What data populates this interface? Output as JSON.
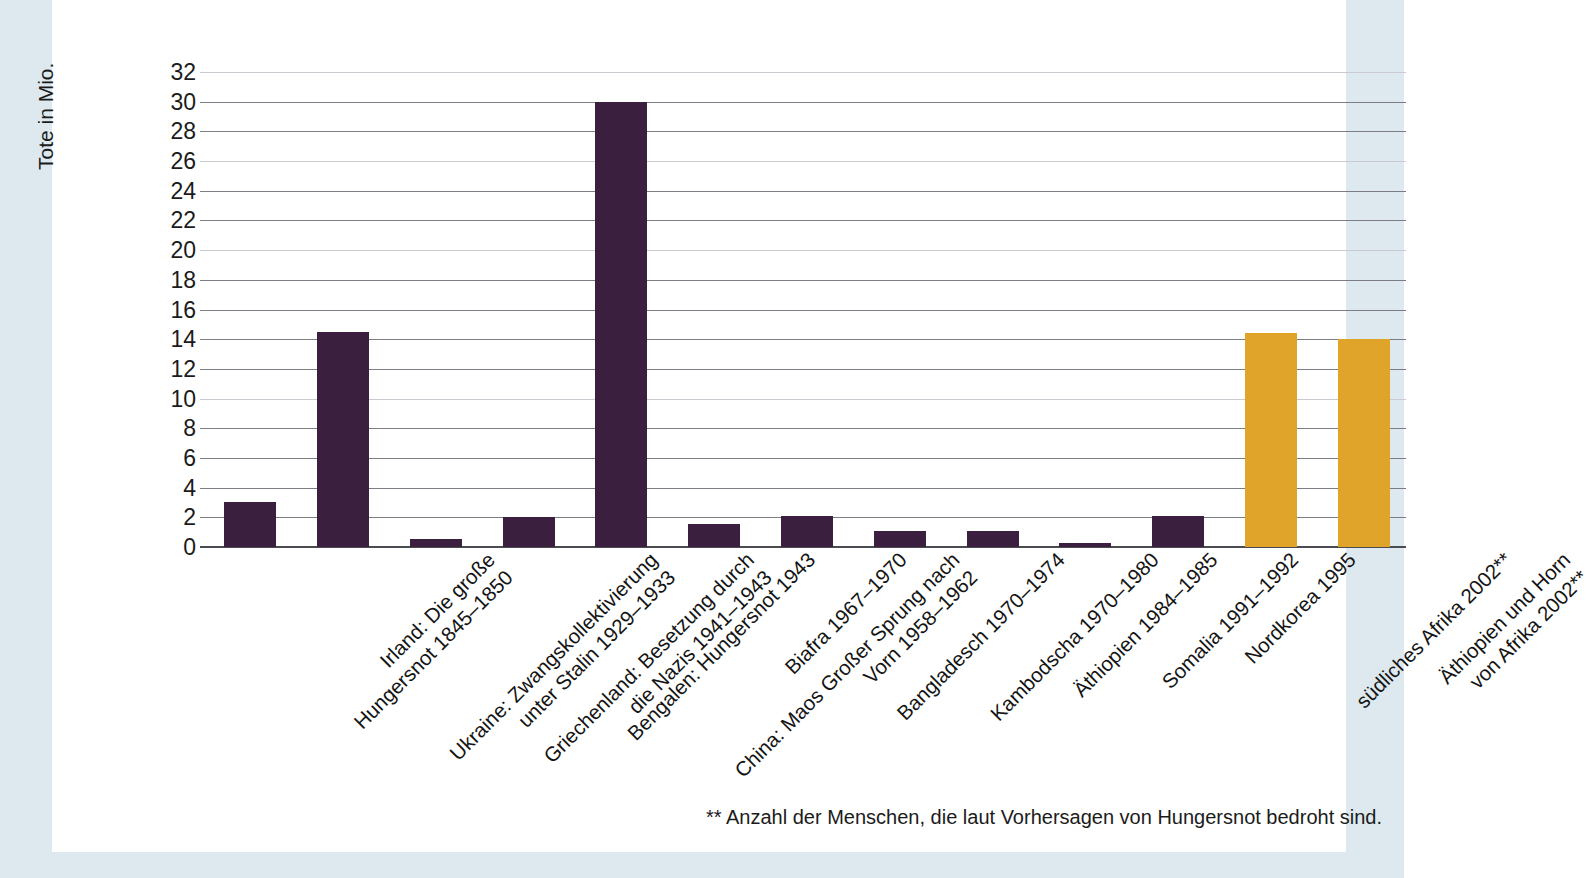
{
  "chart_data": {
    "type": "bar",
    "title": "",
    "subtitle": "",
    "xlabel": "",
    "ylabel": "Tote in Mio.",
    "ylim": [
      0,
      32
    ],
    "ytick_step": 2,
    "yticks": [
      "32",
      "30",
      "28",
      "26",
      "24",
      "22",
      "20",
      "18",
      "16",
      "14",
      "12",
      "10",
      "8",
      "6",
      "4",
      "2",
      "0"
    ],
    "grid": true,
    "legend": "none",
    "categories": [
      "Irland: Die große\nHungersnot 1845–1850",
      "Ukraine: Zwangskollektivierung\nunter Stalin 1929–1933",
      "Griechenland: Besetzung durch\ndie Nazis 1941–1943",
      "Bengalen: Hungersnot 1943",
      "China: Maos Großer Sprung nach\nVorn 1958–1962",
      "Biafra 1967–1970",
      "Bangladesch 1970–1974",
      "Kambodscha 1970–1980",
      "Äthiopien 1984–1985",
      "Somalia 1991–1992",
      "Nordkorea 1995",
      "südliches Afrika 2002**",
      "Äthiopien und Horn\nvon Afrika 2002**"
    ],
    "values": [
      3.0,
      14.5,
      0.55,
      2.05,
      30.0,
      1.55,
      2.1,
      1.1,
      1.1,
      0.3,
      2.1,
      14.4,
      14.0
    ],
    "colors": [
      "#3a1f3e",
      "#3a1f3e",
      "#3a1f3e",
      "#3a1f3e",
      "#3a1f3e",
      "#3a1f3e",
      "#3a1f3e",
      "#3a1f3e",
      "#3a1f3e",
      "#3a1f3e",
      "#3a1f3e",
      "#e0a42b",
      "#e0a42b"
    ]
  },
  "footnote": "** Anzahl der Menschen, die laut Vorhersagen von Hungersnot bedroht sind.",
  "palette": {
    "bar_purple": "#3a1f3e",
    "bar_orange": "#e0a42b",
    "page_background": "#dde9ef",
    "paper": "#ffffff",
    "gridline": "#7c7c84",
    "axis": "#4b4b52",
    "text": "#141414"
  }
}
